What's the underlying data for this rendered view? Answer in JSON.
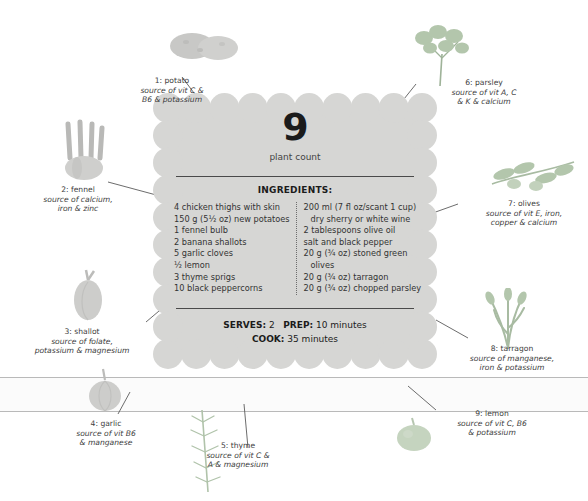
{
  "infographic": {
    "plant_count": {
      "number": "9",
      "label": "plant count"
    },
    "ingredients_heading": "INGREDIENTS:",
    "ingredients_left": [
      "4 chicken thighs with skin",
      "150 g (5½ oz) new potatoes",
      "1 fennel bulb",
      "2 banana shallots",
      "5 garlic cloves",
      "½ lemon",
      "3 thyme sprigs",
      "10 black peppercorns"
    ],
    "ingredients_right": [
      "200 ml (7 fl oz/scant 1 cup)",
      "dry sherry or white wine",
      "2 tablespoons olive oil",
      "salt and black pepper",
      "20 g (¾ oz) stoned green",
      "olives",
      "20 g (¾ oz) tarragon",
      "20 g (¾ oz) chopped parsley"
    ],
    "meta": {
      "serves_label": "SERVES:",
      "serves_value": "2",
      "prep_label": "PREP:",
      "prep_value": "10 minutes",
      "cook_label": "COOK:",
      "cook_value": "35 minutes"
    }
  },
  "callouts": [
    {
      "name": "1: potato",
      "source_line1": "source of vit C &",
      "source_line2": "B6 & potassium"
    },
    {
      "name": "2: fennel",
      "source_line1": "source of calcium,",
      "source_line2": "iron & zinc"
    },
    {
      "name": "3: shallot",
      "source_line1": "source of folate,",
      "source_line2": "potassium & magnesium"
    },
    {
      "name": "4: garlic",
      "source_line1": "source of vit B6",
      "source_line2": "& manganese"
    },
    {
      "name": "5: thyme",
      "source_line1": "source of vit C &",
      "source_line2": "A & magnesium"
    },
    {
      "name": "6: parsley",
      "source_line1": "source of vit A, C",
      "source_line2": "& K & calcium"
    },
    {
      "name": "7: olives",
      "source_line1": "source of vit E, iron,",
      "source_line2": "copper & calcium"
    },
    {
      "name": "8: tarragon",
      "source_line1": "source of manganese,",
      "source_line2": "iron & potassium"
    },
    {
      "name": "9: lemon",
      "source_line1": "source of vit C, B6",
      "source_line2": "& potassium"
    }
  ],
  "colors": {
    "plate": "#d6d6d4",
    "produce_green": "#b9c9b2",
    "produce_grey": "#c9c9c7",
    "text": "#3a3a3a",
    "rule": "#4a4a4a"
  }
}
